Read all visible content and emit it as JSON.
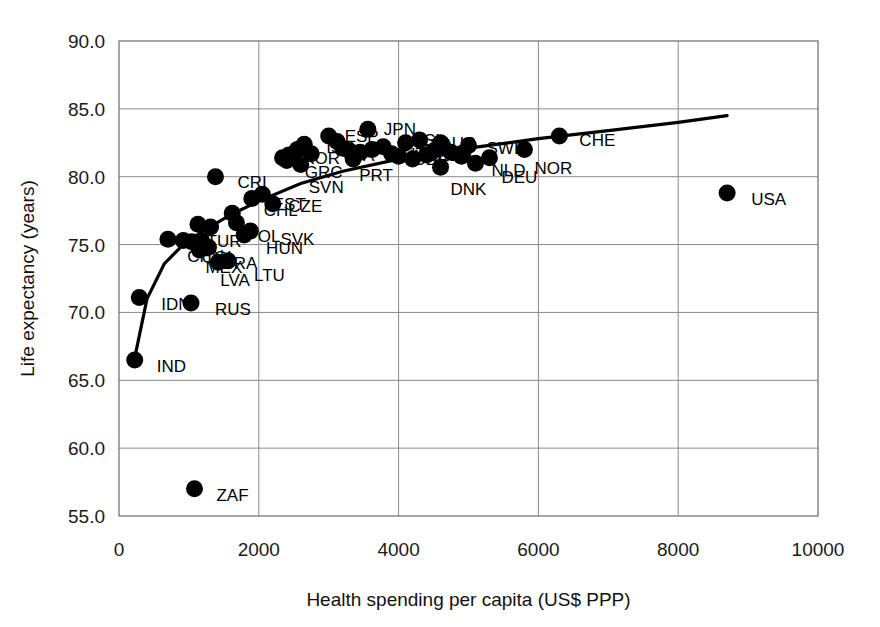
{
  "chart_data": {
    "type": "scatter",
    "title": "",
    "xlabel": "Health spending per capita (US$ PPP)",
    "ylabel": "Life expectancy (years)",
    "xlim": [
      0,
      10000
    ],
    "ylim": [
      55.0,
      90.0
    ],
    "xticks": [
      "0",
      "2000",
      "4000",
      "6000",
      "8000",
      "10000"
    ],
    "xtick_values": [
      0,
      2000,
      4000,
      6000,
      8000,
      10000
    ],
    "yticks": [
      "55.0",
      "60.0",
      "65.0",
      "70.0",
      "75.0",
      "80.0",
      "85.0",
      "90.0"
    ],
    "ytick_values": [
      55.0,
      60.0,
      65.0,
      70.0,
      75.0,
      80.0,
      85.0,
      90.0
    ],
    "grid": true,
    "legend": "none",
    "marker": "filled-circle",
    "marker_color": "#000000",
    "points": [
      {
        "label": "IND",
        "x": 225,
        "y": 66.5,
        "lx": 22,
        "ly": 6
      },
      {
        "label": "IDN",
        "x": 290,
        "y": 71.1,
        "lx": 22,
        "ly": 6
      },
      {
        "label": "ZAF",
        "x": 1080,
        "y": 57.0,
        "lx": 22,
        "ly": 6
      },
      {
        "label": "RUS",
        "x": 1030,
        "y": 70.7,
        "lx": 24,
        "ly": 6
      },
      {
        "label": "",
        "x": 700,
        "y": 75.4,
        "lx": 0,
        "ly": 0
      },
      {
        "label": "CHN",
        "x": 920,
        "y": 75.3,
        "lx": 4,
        "ly": 15
      },
      {
        "label": "COL",
        "x": 1040,
        "y": 75.2,
        "lx": 10,
        "ly": 15
      },
      {
        "label": "",
        "x": 1180,
        "y": 75.3,
        "lx": 0,
        "ly": 0
      },
      {
        "label": "MEX",
        "x": 1150,
        "y": 74.6,
        "lx": 6,
        "ly": 17
      },
      {
        "label": "BRA",
        "x": 1280,
        "y": 74.8,
        "lx": 14,
        "ly": 16
      },
      {
        "label": "LVA",
        "x": 1420,
        "y": 73.7,
        "lx": 2,
        "ly": 18
      },
      {
        "label": "LTU",
        "x": 1560,
        "y": 73.8,
        "lx": 26,
        "ly": 14
      },
      {
        "label": "TUR",
        "x": 1310,
        "y": 76.3,
        "lx": -4,
        "ly": 14
      },
      {
        "label": "",
        "x": 1130,
        "y": 76.5,
        "lx": 0,
        "ly": 0
      },
      {
        "label": "POL",
        "x": 1680,
        "y": 76.6,
        "lx": 10,
        "ly": 13
      },
      {
        "label": "HUN",
        "x": 1790,
        "y": 75.7,
        "lx": 22,
        "ly": 13
      },
      {
        "label": "SVK",
        "x": 1880,
        "y": 76.0,
        "lx": 30,
        "ly": 8
      },
      {
        "label": "CHL",
        "x": 1900,
        "y": 78.4,
        "lx": 12,
        "ly": 12
      },
      {
        "label": "",
        "x": 1620,
        "y": 77.3,
        "lx": 0,
        "ly": 0
      },
      {
        "label": "CRI",
        "x": 1380,
        "y": 80.0,
        "lx": 22,
        "ly": 5
      },
      {
        "label": "CZE",
        "x": 2050,
        "y": 78.7,
        "lx": 26,
        "ly": 12
      },
      {
        "label": "EST",
        "x": 2200,
        "y": 78.0,
        "lx": 0,
        "ly": 0
      },
      {
        "label": "KOR",
        "x": 2550,
        "y": 82.0,
        "lx": 6,
        "ly": 8
      },
      {
        "label": "ISR",
        "x": 2650,
        "y": 82.4,
        "lx": 22,
        "ly": 3
      },
      {
        "label": "GRC",
        "x": 2400,
        "y": 81.2,
        "lx": 18,
        "ly": 12
      },
      {
        "label": "SVN",
        "x": 2600,
        "y": 80.9,
        "lx": 8,
        "ly": 22
      },
      {
        "label": "",
        "x": 2430,
        "y": 81.6,
        "lx": 0,
        "ly": 0
      },
      {
        "label": "",
        "x": 2340,
        "y": 81.4,
        "lx": 0,
        "ly": 0
      },
      {
        "label": "",
        "x": 2750,
        "y": 81.7,
        "lx": 0,
        "ly": 0
      },
      {
        "label": "ESP",
        "x": 3000,
        "y": 83.0,
        "lx": 16,
        "ly": 0
      },
      {
        "label": "ITA",
        "x": 3120,
        "y": 82.6,
        "lx": 12,
        "ly": 14
      },
      {
        "label": "",
        "x": 3200,
        "y": 82.1,
        "lx": 0,
        "ly": 0
      },
      {
        "label": "",
        "x": 3300,
        "y": 81.9,
        "lx": 0,
        "ly": 0
      },
      {
        "label": "JPN",
        "x": 3560,
        "y": 83.5,
        "lx": 16,
        "ly": 0
      },
      {
        "label": "PRT",
        "x": 3350,
        "y": 81.3,
        "lx": 6,
        "ly": 16
      },
      {
        "label": "",
        "x": 3450,
        "y": 81.8,
        "lx": 0,
        "ly": 0
      },
      {
        "label": "",
        "x": 3620,
        "y": 82.0,
        "lx": 0,
        "ly": 0
      },
      {
        "label": "",
        "x": 3780,
        "y": 82.2,
        "lx": 0,
        "ly": 0
      },
      {
        "label": "AUT",
        "x": 3900,
        "y": 81.7,
        "lx": 0,
        "ly": 0
      },
      {
        "label": "FRA",
        "x": 4100,
        "y": 82.5,
        "lx": 14,
        "ly": 2
      },
      {
        "label": "FIN",
        "x": 4000,
        "y": 81.5,
        "lx": 0,
        "ly": 0
      },
      {
        "label": "GBR",
        "x": 4200,
        "y": 81.3,
        "lx": 0,
        "ly": 0
      },
      {
        "label": "ISL",
        "x": 4300,
        "y": 82.7,
        "lx": 0,
        "ly": 0
      },
      {
        "label": "BEL",
        "x": 4400,
        "y": 81.6,
        "lx": 0,
        "ly": 0
      },
      {
        "label": "CAN",
        "x": 4500,
        "y": 81.9,
        "lx": 0,
        "ly": 0
      },
      {
        "label": "AUS",
        "x": 4600,
        "y": 82.5,
        "lx": 0,
        "ly": 0
      },
      {
        "label": "DNK",
        "x": 4600,
        "y": 80.7,
        "lx": 10,
        "ly": 22
      },
      {
        "label": "IRL",
        "x": 4750,
        "y": 81.8,
        "lx": 0,
        "ly": 0
      },
      {
        "label": "NLD",
        "x": 4900,
        "y": 81.5,
        "lx": 30,
        "ly": 14
      },
      {
        "label": "SWE",
        "x": 5000,
        "y": 82.3,
        "lx": 18,
        "ly": 2
      },
      {
        "label": "DEU",
        "x": 5100,
        "y": 81.0,
        "lx": 26,
        "ly": 14
      },
      {
        "label": "",
        "x": 5300,
        "y": 81.4,
        "lx": 0,
        "ly": 0
      },
      {
        "label": "NOR",
        "x": 5800,
        "y": 82.0,
        "lx": 10,
        "ly": 18
      },
      {
        "label": "CHE",
        "x": 6300,
        "y": 83.0,
        "lx": 20,
        "ly": 4
      },
      {
        "label": "USA",
        "x": 8700,
        "y": 78.8,
        "lx": 24,
        "ly": 6
      }
    ],
    "trendline": {
      "description": "logarithmic fit curve",
      "points": [
        {
          "x": 210,
          "y": 66.3
        },
        {
          "x": 400,
          "y": 71.0
        },
        {
          "x": 650,
          "y": 73.6
        },
        {
          "x": 900,
          "y": 74.9
        },
        {
          "x": 1200,
          "y": 76.0
        },
        {
          "x": 1600,
          "y": 77.2
        },
        {
          "x": 2000,
          "y": 78.2
        },
        {
          "x": 2600,
          "y": 79.5
        },
        {
          "x": 3200,
          "y": 80.4
        },
        {
          "x": 4000,
          "y": 81.3
        },
        {
          "x": 5000,
          "y": 82.1
        },
        {
          "x": 6000,
          "y": 82.8
        },
        {
          "x": 7000,
          "y": 83.4
        },
        {
          "x": 8000,
          "y": 84.0
        },
        {
          "x": 8700,
          "y": 84.5
        }
      ]
    }
  }
}
